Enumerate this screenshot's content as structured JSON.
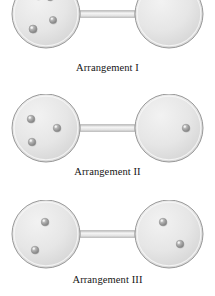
{
  "figure": {
    "title": "",
    "type": "gas-particle-distribution-diagram",
    "background_color": "#ffffff",
    "bulb_fill_color": "#e3e3e3",
    "bulb_edge_color": "#9a9a9a",
    "particle_color": "#9e9e9e",
    "caption_color": "#151515"
  },
  "arrangements": [
    {
      "id": "arrangement-1",
      "caption": "Arrangement I",
      "caption_y": 62,
      "apparatus_y": -8,
      "left_bulb": {
        "cx": 46,
        "cy": 22,
        "r": 34,
        "particles": [
          {
            "cx": 38,
            "cy": 4,
            "r": 3.6
          },
          {
            "cx": 50,
            "cy": 5,
            "r": 3.6
          },
          {
            "cx": 53,
            "cy": 28,
            "r": 3.6
          },
          {
            "cx": 33,
            "cy": 37,
            "r": 4.0
          }
        ],
        "particle_count": 4
      },
      "right_bulb": {
        "cx": 169,
        "cy": 22,
        "r": 34,
        "particles": [],
        "particle_count": 0
      },
      "tube": {
        "x1": 80,
        "x2": 135,
        "cy": 22,
        "half_height": 3.2
      }
    },
    {
      "id": "arrangement-2",
      "caption": "Arrangement II",
      "caption_y": 166,
      "apparatus_y": 94,
      "left_bulb": {
        "cx": 46,
        "cy": 34,
        "r": 34,
        "particles": [
          {
            "cx": 31,
            "cy": 25,
            "r": 3.8
          },
          {
            "cx": 57,
            "cy": 34,
            "r": 3.8
          },
          {
            "cx": 32,
            "cy": 48,
            "r": 3.8
          }
        ],
        "particle_count": 3
      },
      "right_bulb": {
        "cx": 169,
        "cy": 34,
        "r": 34,
        "particles": [
          {
            "cx": 186,
            "cy": 34,
            "r": 3.8
          }
        ],
        "particle_count": 1
      },
      "tube": {
        "x1": 80,
        "x2": 135,
        "cy": 34,
        "half_height": 3.2
      }
    },
    {
      "id": "arrangement-3",
      "caption": "Arrangement III",
      "caption_y": 274,
      "apparatus_y": 200,
      "left_bulb": {
        "cx": 46,
        "cy": 34,
        "r": 34,
        "particles": [
          {
            "cx": 45,
            "cy": 22,
            "r": 3.8
          },
          {
            "cx": 35,
            "cy": 50,
            "r": 3.8
          }
        ],
        "particle_count": 2
      },
      "right_bulb": {
        "cx": 169,
        "cy": 34,
        "r": 34,
        "particles": [
          {
            "cx": 163,
            "cy": 22,
            "r": 3.8
          },
          {
            "cx": 180,
            "cy": 44,
            "r": 3.8
          }
        ],
        "particle_count": 2
      },
      "tube": {
        "x1": 80,
        "x2": 135,
        "cy": 34,
        "half_height": 3.2
      }
    }
  ]
}
